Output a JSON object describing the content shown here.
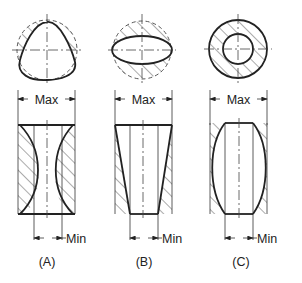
{
  "figure": {
    "type": "technical-diagram",
    "panels": [
      {
        "id": "A",
        "caption": "(A)",
        "plan_shape": "lobed / triangular out-of-round bore",
        "section_shape": "hourglass (concave, barrel-waisted)",
        "max_label": "Max",
        "min_label": "Min"
      },
      {
        "id": "B",
        "caption": "(B)",
        "plan_shape": "elliptical (oval) bore",
        "section_shape": "tapered bore",
        "max_label": "Max",
        "min_label": "Min"
      },
      {
        "id": "C",
        "caption": "(C)",
        "plan_shape": "round concentric bore",
        "section_shape": "barrel (convex)",
        "max_label": "Max",
        "min_label": "Min"
      }
    ]
  }
}
